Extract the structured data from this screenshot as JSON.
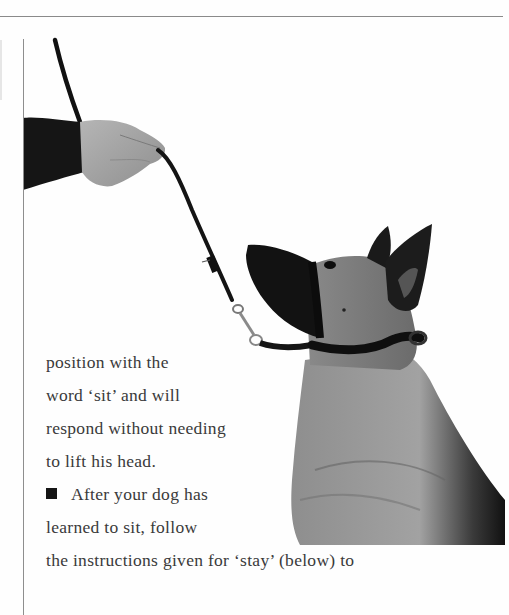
{
  "document": {
    "type": "scanned book page",
    "topic": "dog training - sit command with head collar",
    "photo": {
      "description": "Hand holding a leash attached to a head collar on a seated German Shepherd-type dog looking up",
      "subjects": [
        "hand-with-dark-sleeve",
        "leash",
        "leash-clip",
        "dog",
        "head-collar"
      ]
    },
    "text_lines": [
      "position with the",
      "word ‘sit’ and will",
      "respond without needing",
      "to lift his head.",
      "After your dog has",
      "learned to sit, follow",
      "the instructions given for ‘stay’ (below) to"
    ],
    "bullet_glyph": "■",
    "colors": {
      "text": "#3a3a3a",
      "rule": "#8a8a8a",
      "background": "#fefefe"
    }
  }
}
